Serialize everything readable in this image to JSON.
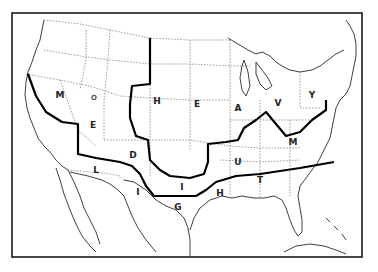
{
  "map": {
    "title": "",
    "zones": [
      {
        "name": "HEAVY",
        "letters": [
          {
            "char": "H",
            "x": 157,
            "y": 104
          },
          {
            "char": "E",
            "x": 197,
            "y": 107
          },
          {
            "char": "A",
            "x": 238,
            "y": 111
          },
          {
            "char": "V",
            "x": 278,
            "y": 106
          },
          {
            "char": "Y",
            "x": 312,
            "y": 98
          }
        ]
      },
      {
        "name": "MEDIUM",
        "letters": [
          {
            "char": "M",
            "x": 60,
            "y": 98
          },
          {
            "char": "E",
            "x": 93,
            "y": 128
          },
          {
            "char": "D",
            "x": 133,
            "y": 158
          },
          {
            "char": "I",
            "x": 182,
            "y": 190
          },
          {
            "char": "U",
            "x": 238,
            "y": 165
          },
          {
            "char": "M",
            "x": 293,
            "y": 145
          }
        ]
      },
      {
        "name": "LIGHT",
        "letters": [
          {
            "char": "L",
            "x": 96,
            "y": 173
          },
          {
            "char": "I",
            "x": 138,
            "y": 195
          },
          {
            "char": "G",
            "x": 178,
            "y": 210
          },
          {
            "char": "H",
            "x": 220,
            "y": 196
          },
          {
            "char": "T",
            "x": 260,
            "y": 183
          }
        ]
      }
    ],
    "extra_marks": [
      {
        "char": "O",
        "x": 94,
        "y": 100
      }
    ]
  }
}
